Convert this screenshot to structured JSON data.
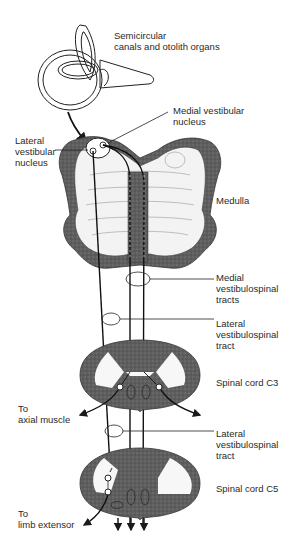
{
  "diagram": {
    "type": "anatomical-pathway",
    "labels": {
      "semicircular": "Semicircular\ncanals and otolith organs",
      "medial_nucleus": "Medial vestibular\nnucleus",
      "lateral_nucleus": "Lateral\nvestibular\nnucleus",
      "medulla": "Medulla",
      "medial_tracts": "Medial\nvestibulospinal\ntracts",
      "lateral_tract_1": "Lateral\nvestibulospinal\ntract",
      "spinal_c3": "Spinal cord C3",
      "axial_muscle": "To\naxial muscle",
      "lateral_tract_2": "Lateral\nvestibulospinal\ntract",
      "spinal_c5": "Spinal cord C5",
      "limb_extensor": "To\nlimb extensor"
    },
    "colors": {
      "line": "#1a1a1a",
      "gray_matter": "#6b6b6b",
      "white_matter": "#f2f2f2"
    }
  }
}
